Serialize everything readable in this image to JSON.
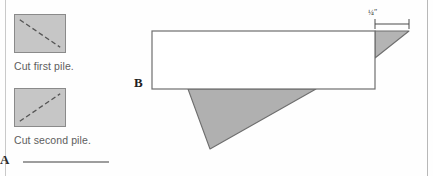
{
  "page": {
    "background_color": "#fefefe",
    "width": 433,
    "height": 176
  },
  "left_panel": {
    "items": [
      {
        "swatch_name": "first-pile-swatch",
        "caption": "Cut first pile.",
        "fill_color": "#c6c6c6",
        "border_color": "#8a8a8a",
        "diagonal_direction": "top-left-to-bottom-right",
        "line_style": "dashed"
      },
      {
        "swatch_name": "second-pile-swatch",
        "caption": "Cut second pile.",
        "fill_color": "#c6c6c6",
        "border_color": "#8a8a8a",
        "diagonal_direction": "bottom-left-to-top-right",
        "line_style": "dashed"
      }
    ]
  },
  "section_a": {
    "label": "A",
    "rule_color": "#9d9d9d"
  },
  "section_b": {
    "label": "B",
    "dimension_label": "¼″",
    "rectangle": {
      "stroke_color": "#6e6e6e",
      "fill_color": "#ffffff"
    },
    "shaded_shapes": [
      {
        "name": "top-right-cut-triangle",
        "fill_color": "#b4b4b4",
        "stroke_color": "#6e6e6e",
        "position": "top-right"
      },
      {
        "name": "bottom-cut-triangle",
        "fill_color": "#b0b0b0",
        "stroke_color": "#6e6e6e",
        "position": "bottom-center"
      }
    ]
  }
}
